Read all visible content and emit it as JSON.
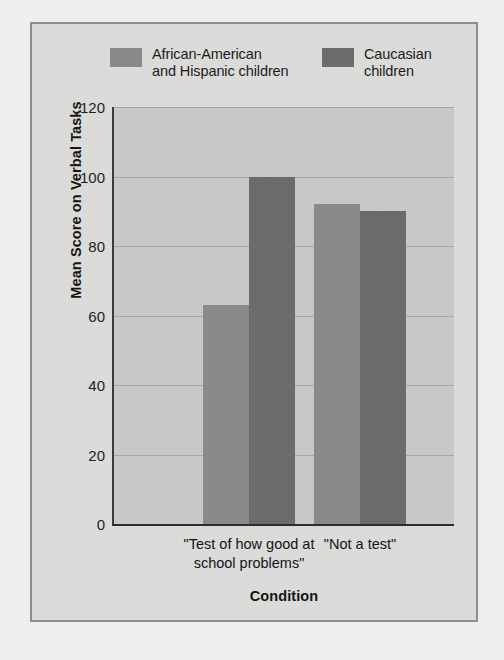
{
  "chart_data": {
    "type": "bar",
    "title": "",
    "xlabel": "Condition",
    "ylabel": "Mean Score on Verbal Tasks",
    "categories": [
      "\"Test of how good at\nschool problems\"",
      "\"Not a test\""
    ],
    "series": [
      {
        "name": "African-American\nand Hispanic children",
        "values": [
          63,
          92
        ],
        "color": "#8b8b8b"
      },
      {
        "name": "Caucasian\nchildren",
        "values": [
          100,
          90
        ],
        "color": "#6d6d6d"
      }
    ],
    "ylim": [
      0,
      120
    ],
    "yticks": [
      0,
      20,
      40,
      60,
      80,
      100,
      120
    ],
    "ytick_labels": [
      "0",
      "20",
      "40",
      "60",
      "80",
      "100",
      "120"
    ],
    "grid": true,
    "legend_position": "top"
  },
  "style": {
    "page_background": "#f1f0ee",
    "figure_background": "#dcdcda",
    "plot_background": "#c9c9c7",
    "frame_border": "#8e8e8e",
    "axis_color": "#2c2c2c",
    "gridline_color": "#a9a9a7",
    "text_color": "#141414"
  }
}
